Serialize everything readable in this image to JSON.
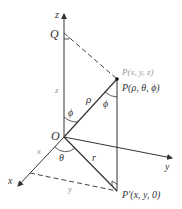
{
  "figure": {
    "axes": {
      "x": "x",
      "y": "y",
      "z": "z"
    },
    "labels": {
      "origin": "O",
      "q": "Q",
      "p_cartesian": "P(x, y, z)",
      "p_spherical": "P(ρ, θ, ϕ)",
      "p_prime": "P′(x, y, 0)",
      "rho": "ρ",
      "r": "r",
      "theta": "θ",
      "phi_at_o": "ϕ",
      "phi_at_p": "ϕ",
      "z_len": "z",
      "x_len": "x",
      "y_len": "y"
    },
    "colors": {
      "line": "#333333",
      "dashed": "#444444",
      "gray_text": "#999999"
    }
  }
}
